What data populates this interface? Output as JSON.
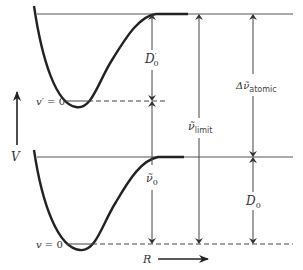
{
  "diagram": {
    "axes": {
      "y_label": "V",
      "x_label": "R"
    },
    "upper_state": {
      "level_label_prefix": "v′ = ",
      "level_value": "0",
      "dissociation_label": "D",
      "dissociation_sub": "0",
      "dissociation_prime": "′"
    },
    "lower_state": {
      "level_label_prefix": "v = ",
      "level_value": "0",
      "dissociation_label": "D",
      "dissociation_sub": "0"
    },
    "transitions": {
      "nu0_label": "ν̃",
      "nu0_sub": "0",
      "limit_label": "ν̃",
      "limit_sub": "limit",
      "atomic_label": "Δν̃",
      "atomic_sub": "atomic"
    },
    "colors": {
      "line": "#222222",
      "thin_line": "#555555",
      "text": "#333333"
    }
  }
}
